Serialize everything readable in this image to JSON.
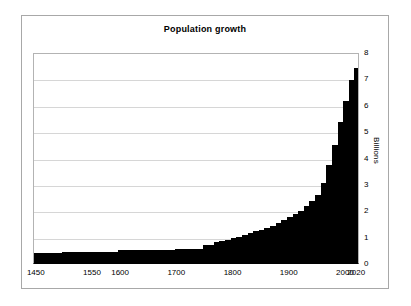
{
  "chart_data": {
    "type": "bar",
    "title": "Population growth",
    "xlabel": "",
    "ylabel": "Billions",
    "ylim": [
      0,
      8
    ],
    "xlim": [
      1450,
      2030
    ],
    "grid": true,
    "legend": false,
    "legend_position": "none",
    "bar_color": "#000000",
    "y_ticks": [
      0,
      1,
      2,
      3,
      4,
      5,
      6,
      7,
      8
    ],
    "y_tick_labels": [
      "0",
      "1",
      "2",
      "3",
      "4",
      "5",
      "6",
      "7",
      "8"
    ],
    "y_axis_side": "right",
    "x_tick_labels": [
      "1450",
      "1550",
      "1600",
      "1700",
      "1800",
      "1900",
      "2000",
      "2020"
    ],
    "x_tick_values": [
      1450,
      1550,
      1600,
      1700,
      1800,
      1900,
      2000,
      2020
    ],
    "x": [
      1450,
      1460,
      1470,
      1480,
      1490,
      1500,
      1510,
      1520,
      1530,
      1540,
      1550,
      1560,
      1570,
      1580,
      1590,
      1600,
      1610,
      1620,
      1630,
      1640,
      1650,
      1660,
      1670,
      1680,
      1690,
      1700,
      1710,
      1720,
      1730,
      1740,
      1750,
      1760,
      1770,
      1780,
      1790,
      1800,
      1810,
      1820,
      1830,
      1840,
      1850,
      1860,
      1870,
      1880,
      1890,
      1900,
      1910,
      1920,
      1930,
      1940,
      1950,
      1960,
      1970,
      1980,
      1990,
      2000,
      2010,
      2020
    ],
    "values": [
      0.37,
      0.37,
      0.37,
      0.37,
      0.37,
      0.43,
      0.43,
      0.43,
      0.43,
      0.43,
      0.43,
      0.43,
      0.43,
      0.43,
      0.43,
      0.5,
      0.5,
      0.5,
      0.5,
      0.5,
      0.5,
      0.5,
      0.5,
      0.5,
      0.5,
      0.53,
      0.53,
      0.53,
      0.53,
      0.53,
      0.7,
      0.7,
      0.78,
      0.83,
      0.88,
      0.95,
      1.0,
      1.05,
      1.13,
      1.2,
      1.26,
      1.33,
      1.4,
      1.5,
      1.62,
      1.75,
      1.87,
      1.96,
      2.15,
      2.35,
      2.57,
      3.05,
      3.72,
      4.47,
      5.33,
      6.15,
      6.95,
      7.4
    ],
    "annotations": []
  }
}
